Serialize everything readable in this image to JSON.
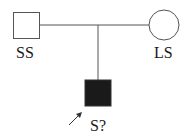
{
  "diagram": {
    "type": "pedigree",
    "individuals": [
      {
        "id": "father",
        "shape": "square",
        "affected": false,
        "label": "SS"
      },
      {
        "id": "mother",
        "shape": "circle",
        "affected": false,
        "label": "LS"
      },
      {
        "id": "proband",
        "shape": "square",
        "affected": true,
        "label": "S?",
        "proband": true
      }
    ],
    "relationships": [
      {
        "type": "mating",
        "between": [
          "father",
          "mother"
        ]
      },
      {
        "type": "offspring",
        "parents": [
          "father",
          "mother"
        ],
        "child": "proband"
      }
    ],
    "colors": {
      "line": "#555555",
      "affected_fill": "#1a1a1a",
      "unaffected_fill": "#ffffff"
    }
  }
}
